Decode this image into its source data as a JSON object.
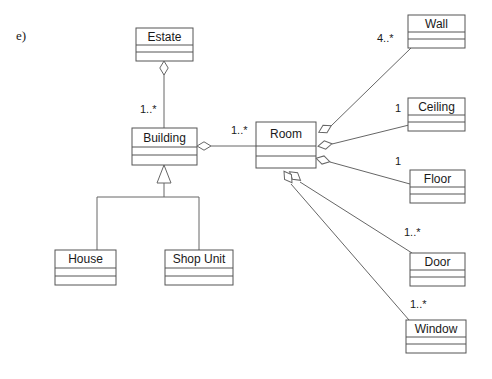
{
  "figure": {
    "label": "e)"
  },
  "classes": [
    {
      "id": "estate",
      "name": "Estate",
      "x": 136,
      "y": 28,
      "w": 57,
      "h": 33
    },
    {
      "id": "building",
      "name": "Building",
      "x": 132,
      "y": 128,
      "w": 65,
      "h": 37
    },
    {
      "id": "house",
      "name": "House",
      "x": 55,
      "y": 250,
      "w": 61,
      "h": 35
    },
    {
      "id": "shopunit",
      "name": "Shop Unit",
      "x": 165,
      "y": 250,
      "w": 68,
      "h": 35
    },
    {
      "id": "room",
      "name": "Room",
      "x": 256,
      "y": 122,
      "w": 60,
      "h": 46
    },
    {
      "id": "wall",
      "name": "Wall",
      "x": 408,
      "y": 15,
      "w": 57,
      "h": 33
    },
    {
      "id": "ceiling",
      "name": "Ceiling",
      "x": 408,
      "y": 98,
      "w": 57,
      "h": 33
    },
    {
      "id": "floor",
      "name": "Floor",
      "x": 410,
      "y": 170,
      "w": 55,
      "h": 33
    },
    {
      "id": "door",
      "name": "Door",
      "x": 410,
      "y": 253,
      "w": 55,
      "h": 33
    },
    {
      "id": "window",
      "name": "Window",
      "x": 406,
      "y": 320,
      "w": 60,
      "h": 33
    }
  ],
  "associations": [
    {
      "id": "estate-building",
      "from": "estate",
      "to": "building",
      "kind": "aggregation",
      "multiplicity": "1..*",
      "label_x": 140,
      "label_y": 113,
      "diamond_x": 164,
      "diamond_y": 68,
      "diamond_rot": 90,
      "path": "M 164 61 L 164 75 L 164 128"
    },
    {
      "id": "building-room",
      "from": "building",
      "to": "room",
      "kind": "aggregation",
      "multiplicity": "1..*",
      "label_x": 231,
      "label_y": 134,
      "diamond_x": 204,
      "diamond_y": 146,
      "diamond_rot": 0,
      "path": "M 211 146 L 256 146"
    },
    {
      "id": "room-wall",
      "from": "room",
      "to": "wall",
      "kind": "aggregation",
      "multiplicity": "4..*",
      "label_x": 377,
      "label_y": 42,
      "diamond_x": 325,
      "diamond_y": 129,
      "diamond_rot": -28,
      "path": "M 331 126 L 411 48"
    },
    {
      "id": "room-ceiling",
      "from": "room",
      "to": "ceiling",
      "kind": "aggregation",
      "multiplicity": "1",
      "label_x": 395,
      "label_y": 112,
      "diamond_x": 325,
      "diamond_y": 145,
      "diamond_rot": -10,
      "path": "M 332 144 L 409 125"
    },
    {
      "id": "room-floor",
      "from": "room",
      "to": "floor",
      "kind": "aggregation",
      "multiplicity": "1",
      "label_x": 395,
      "label_y": 165,
      "diamond_x": 323,
      "diamond_y": 160,
      "diamond_rot": 14,
      "path": "M 330 162 L 410 184"
    },
    {
      "id": "room-door",
      "from": "room",
      "to": "door",
      "kind": "aggregation",
      "multiplicity": "1..*",
      "label_x": 404,
      "label_y": 236,
      "diamond_x": 295,
      "diamond_y": 176,
      "diamond_rot": 38,
      "path": "M 300 182 L 412 253"
    },
    {
      "id": "room-window",
      "from": "room",
      "to": "window",
      "kind": "aggregation",
      "multiplicity": "1..*",
      "label_x": 410,
      "label_y": 308,
      "diamond_x": 288,
      "diamond_y": 177,
      "diamond_rot": 55,
      "path": "M 291 184 L 409 320"
    }
  ],
  "generalization": {
    "id": "building-subclasses",
    "parent": "building",
    "children": [
      "house",
      "shopunit"
    ],
    "arrow_points": "164,165 157,183 171,183",
    "stem": "M 164 183 L 164 197",
    "bar": "M 97 197 L 199 197",
    "drops": [
      "M 97 197 L 97 250",
      "M 199 197 L 199 250"
    ]
  }
}
